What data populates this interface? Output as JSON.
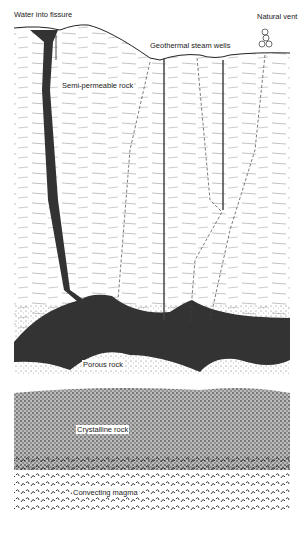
{
  "diagram": {
    "labels": {
      "water_into_fissure": "Water into fissure",
      "natural_vent": "Natural vent",
      "geothermal_steam_wells": "Geothermal steam wells",
      "semi_permeable_rock": "Semi-permeable rock",
      "porous_rock": "Porous rock",
      "crystalline_rock": "Crystalline rock",
      "convecting_magma": "Convecting magma"
    },
    "layers": [
      "Semi-permeable rock",
      "Porous rock",
      "Crystalline rock",
      "Convecting magma"
    ],
    "colors": {
      "ink": "#222222",
      "reservoir": "#333333",
      "background": "#ffffff"
    }
  }
}
